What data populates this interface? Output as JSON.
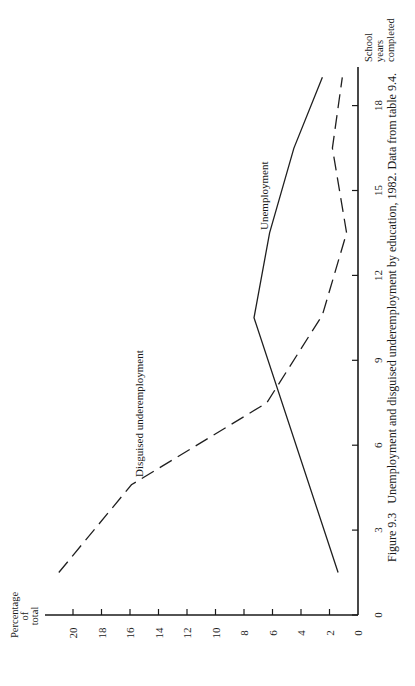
{
  "figure": {
    "caption": "Figure 9.3   Unemployment and disguised underemployment by education, 1982. Data from table 9.4.",
    "orientation": "rotated 90° counter-clockwise on page"
  },
  "axes": {
    "x_title_lines": [
      "School",
      "years",
      "completed"
    ],
    "y_title_lines": [
      "Percentage",
      "of",
      "total"
    ],
    "x_ticks": [
      "0",
      "3",
      "6",
      "9",
      "12",
      "15",
      "18"
    ],
    "y_ticks": [
      "0",
      "2",
      "4",
      "6",
      "8",
      "10",
      "12",
      "14",
      "16",
      "18",
      "20"
    ]
  },
  "series_labels": {
    "unemployment": "Unemployment",
    "disguised": "Disguised underemployment"
  },
  "colors": {
    "ink": "#1a1a1a",
    "background": "#ffffff"
  },
  "chart_data": {
    "type": "line",
    "title": "Unemployment and disguised underemployment by education, 1982",
    "caption": "Figure 9.3   Unemployment and disguised underemployment by education, 1982. Data from table 9.4.",
    "xlabel": "School years completed",
    "ylabel": "Percentage of total",
    "xlim": [
      0,
      19.5
    ],
    "ylim": [
      0,
      22
    ],
    "x_ticks": [
      0,
      3,
      6,
      9,
      12,
      15,
      18
    ],
    "y_ticks": [
      0,
      2,
      4,
      6,
      8,
      10,
      12,
      14,
      16,
      18,
      20
    ],
    "grid": false,
    "legend": "inline labels on lines",
    "series": [
      {
        "name": "Unemployment",
        "style": "solid",
        "x": [
          1.5,
          10.5,
          13.5,
          16.5,
          19.0
        ],
        "y": [
          1.4,
          7.3,
          6.2,
          4.5,
          2.5
        ]
      },
      {
        "name": "Disguised underemployment",
        "style": "dashed",
        "x": [
          1.5,
          4.6,
          7.5,
          10.6,
          13.5,
          16.5,
          19.0
        ],
        "y": [
          21.0,
          15.9,
          6.4,
          2.5,
          0.8,
          1.8,
          1.1
        ]
      }
    ]
  }
}
